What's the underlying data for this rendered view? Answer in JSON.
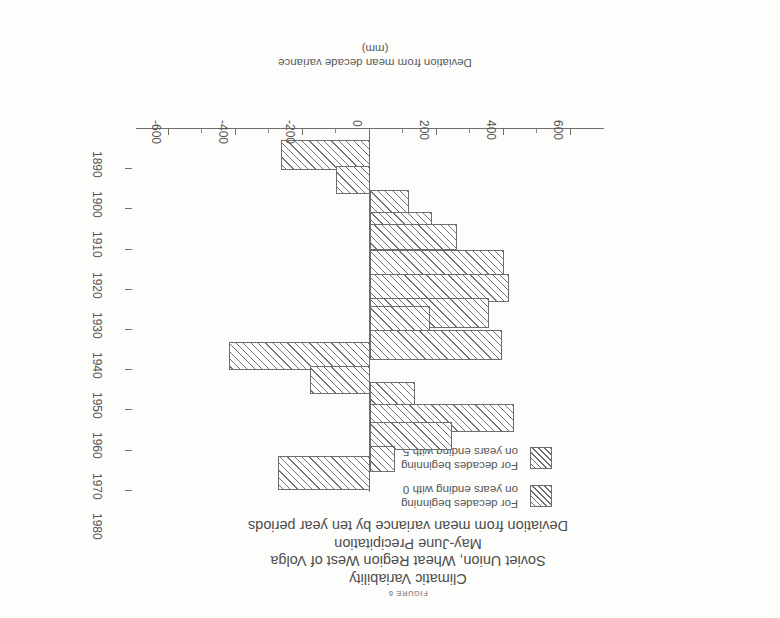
{
  "figure": {
    "caption": "FIGURE 6",
    "title_lines": [
      "Climatic Variability",
      "Soviet Union, Wheat Region West of Volga",
      "May-June Precipitation",
      "Deviation from mean variance by ten year periods"
    ]
  },
  "legend": {
    "entries": [
      {
        "swatch": "hatch-diagonal-series-0",
        "line1": "For decades beginning",
        "line2": "on years ending with 0"
      },
      {
        "swatch": "hatch-diagonal-series-5",
        "line1": "For decades beginning",
        "line2": "on years ending with 5"
      }
    ]
  },
  "axes": {
    "value_axis": {
      "label_line1": "Deviation from mean decade variance",
      "label_line2": "(mm)",
      "unit": "mm",
      "ticks": [
        "600",
        "400",
        "200",
        "0",
        "-200",
        "-400",
        "-600"
      ],
      "tick_values": [
        600,
        400,
        200,
        0,
        -200,
        -400,
        -600
      ],
      "range": [
        -700,
        700
      ]
    },
    "category_axis": {
      "ticks": [
        "1890",
        "1900",
        "1910",
        "1920",
        "1930",
        "1940",
        "1950",
        "1960",
        "1970",
        "1980"
      ],
      "label": ""
    }
  },
  "colors": {
    "ink": "#6e6e6e",
    "hatch": "#757575",
    "paper": "#fdfdfb",
    "text": "#555555"
  },
  "chart_data": {
    "type": "bar",
    "orientation": "horizontal",
    "subtitle": "Deviation from mean variance by ten year periods",
    "xlabel": "Deviation from mean decade variance (mm)",
    "ylabel": "",
    "xlim": [
      -700,
      700
    ],
    "grid": false,
    "legend_position": "top-left",
    "categories": [
      "1890",
      "1900",
      "1910",
      "1920",
      "1930",
      "1940",
      "1950",
      "1960",
      "1970",
      "1980"
    ],
    "series": [
      {
        "name": "For decades beginning on years ending with 0",
        "values": [
          -265,
          -60,
          115,
          260,
          415,
          180,
          -420,
          135,
          245,
          -275
        ]
      },
      {
        "name": "For decades beginning on years ending with 5",
        "values": [
          -100,
          null,
          185,
          400,
          355,
          395,
          -180,
          430,
          75,
          null
        ]
      }
    ]
  },
  "bars": [
    {
      "decade": "1890",
      "series": "0",
      "value": -265,
      "top": 448,
      "height": 30,
      "x": 410,
      "w": 89,
      "dir": "neg"
    },
    {
      "decade": "1890",
      "series": "5",
      "value": -100,
      "top": 424,
      "height": 28,
      "x": 410,
      "w": 34,
      "dir": "neg"
    },
    {
      "decade": "1900",
      "series": "0",
      "value": -60,
      "top": 424,
      "height": 28,
      "x": 410,
      "w": 34,
      "dir": "neg"
    },
    {
      "decade": "1910",
      "series": "0",
      "value": 115,
      "top": 398,
      "height": 30,
      "x": 371,
      "w": 39,
      "dir": "pos"
    },
    {
      "decade": "1910",
      "series": "5",
      "value": 185,
      "top": 376,
      "height": 30,
      "x": 348,
      "w": 62,
      "dir": "pos"
    },
    {
      "decade": "1920",
      "series": "0",
      "value": 260,
      "top": 368,
      "height": 26,
      "x": 323,
      "w": 87,
      "dir": "pos"
    },
    {
      "decade": "1920",
      "series": "5",
      "value": 400,
      "top": 338,
      "height": 30,
      "x": 276,
      "w": 134,
      "dir": "pos"
    },
    {
      "decade": "1930",
      "series": "0",
      "value": 415,
      "top": 316,
      "height": 28,
      "x": 271,
      "w": 139,
      "dir": "pos"
    },
    {
      "decade": "1930",
      "series": "5",
      "value": 355,
      "top": 290,
      "height": 30,
      "x": 291,
      "w": 119,
      "dir": "pos"
    },
    {
      "decade": "1940",
      "series": "0",
      "value": 180,
      "top": 286,
      "height": 26,
      "x": 350,
      "w": 60,
      "dir": "pos"
    },
    {
      "decade": "1940",
      "series": "5",
      "value": 395,
      "top": 258,
      "height": 30,
      "x": 278,
      "w": 132,
      "dir": "pos"
    },
    {
      "decade": "1950",
      "series": "0",
      "value": -420,
      "top": 248,
      "height": 28,
      "x": 410,
      "w": 141,
      "dir": "neg"
    },
    {
      "decade": "1950",
      "series": "5",
      "value": -180,
      "top": 224,
      "height": 28,
      "x": 410,
      "w": 60,
      "dir": "neg"
    },
    {
      "decade": "1960",
      "series": "0",
      "value": 135,
      "top": 210,
      "height": 26,
      "x": 365,
      "w": 45,
      "dir": "pos"
    },
    {
      "decade": "1960",
      "series": "5",
      "value": 430,
      "top": 186,
      "height": 28,
      "x": 266,
      "w": 144,
      "dir": "pos"
    },
    {
      "decade": "1970",
      "series": "0",
      "value": 245,
      "top": 168,
      "height": 28,
      "x": 328,
      "w": 82,
      "dir": "pos"
    },
    {
      "decade": "1970",
      "series": "5",
      "value": 75,
      "top": 146,
      "height": 26,
      "x": 385,
      "w": 25,
      "dir": "pos"
    },
    {
      "decade": "1980",
      "series": "0",
      "value": -275,
      "top": 128,
      "height": 34,
      "x": 410,
      "w": 92,
      "dir": "neg"
    }
  ]
}
